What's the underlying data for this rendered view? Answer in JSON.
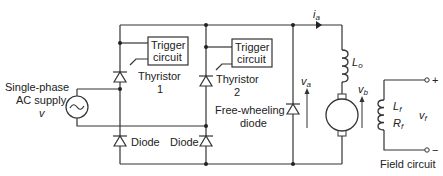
{
  "diagram": {
    "type": "half-controlled single-phase bridge rectifier driving separately excited DC motor",
    "supply": {
      "label_line1": "Single-phase",
      "label_line2": "AC supply",
      "symbol": "v"
    },
    "trigger1": {
      "line1": "Trigger",
      "line2": "circuit"
    },
    "trigger2": {
      "line1": "Trigger",
      "line2": "circuit"
    },
    "thyristor1": {
      "line1": "Thyristor",
      "line2": "1"
    },
    "thyristor2": {
      "line1": "Thyristor",
      "line2": "2"
    },
    "diode1": {
      "label": "Diode"
    },
    "diode2": {
      "label": "Diode"
    },
    "freewheel": {
      "line1": "Free-wheeling",
      "line2": "diode"
    },
    "armature_current": "i",
    "armature_current_sub": "a",
    "va": "v",
    "va_sub": "a",
    "vb": "v",
    "vb_sub": "b",
    "inductor": "L",
    "inductor_sub": "o",
    "field": {
      "Lf": "L",
      "Lf_sub": "f",
      "Rf": "R",
      "Rf_sub": "f",
      "vf": "v",
      "vf_sub": "f",
      "plus": "+",
      "minus": "−",
      "caption": "Field circuit"
    }
  }
}
